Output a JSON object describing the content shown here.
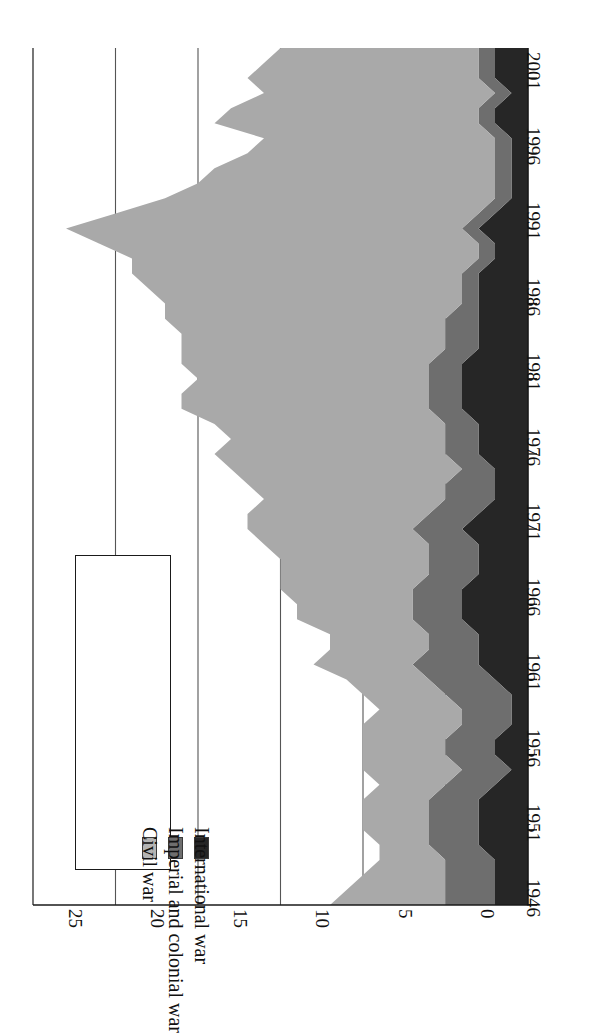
{
  "chart_data": {
    "type": "area",
    "title": "",
    "subtitle": "",
    "xlabel": "",
    "ylabel": "",
    "orientation": "rotated-90-ccw",
    "stacked": true,
    "grid": true,
    "legend_position": "inside-left",
    "xlim": [
      1946,
      2003
    ],
    "ylim": [
      0,
      30
    ],
    "y_ticks": [
      "0",
      "5",
      "10",
      "15",
      "20",
      "25",
      "30"
    ],
    "y_tick_values": [
      0,
      5,
      10,
      15,
      20,
      25,
      30
    ],
    "x_ticks": [
      "1946",
      "1951",
      "1956",
      "1961",
      "1966",
      "1971",
      "1976",
      "1981",
      "1986",
      "1991",
      "1996",
      "2001"
    ],
    "x_tick_values": [
      1946,
      1951,
      1956,
      1961,
      1966,
      1971,
      1976,
      1981,
      1986,
      1991,
      1996,
      2001
    ],
    "x": [
      1946,
      1947,
      1948,
      1949,
      1950,
      1951,
      1952,
      1953,
      1954,
      1955,
      1956,
      1957,
      1958,
      1959,
      1960,
      1961,
      1962,
      1963,
      1964,
      1965,
      1966,
      1967,
      1968,
      1969,
      1970,
      1971,
      1972,
      1973,
      1974,
      1975,
      1976,
      1977,
      1978,
      1979,
      1980,
      1981,
      1982,
      1983,
      1984,
      1985,
      1986,
      1987,
      1988,
      1989,
      1990,
      1991,
      1992,
      1993,
      1994,
      1995,
      1996,
      1997,
      1998,
      1999,
      2000,
      2001,
      2002,
      2003
    ],
    "series": [
      {
        "name": "International war",
        "color": "#262626",
        "values": [
          2,
          2,
          2,
          2,
          3,
          3,
          3,
          3,
          2,
          1,
          2,
          2,
          1,
          1,
          1,
          2,
          3,
          3,
          3,
          4,
          4,
          4,
          3,
          3,
          3,
          4,
          3,
          2,
          2,
          2,
          3,
          3,
          3,
          4,
          4,
          4,
          4,
          3,
          3,
          3,
          3,
          3,
          3,
          2,
          2,
          3,
          2,
          1,
          1,
          1,
          1,
          1,
          2,
          2,
          1,
          2,
          2,
          2
        ]
      },
      {
        "name": "Imperial and colonial war",
        "color": "#6e6e6e",
        "values": [
          3,
          3,
          3,
          3,
          3,
          3,
          3,
          3,
          3,
          3,
          3,
          3,
          3,
          3,
          4,
          4,
          4,
          3,
          3,
          3,
          3,
          3,
          3,
          3,
          3,
          3,
          3,
          3,
          3,
          2,
          2,
          2,
          2,
          2,
          2,
          2,
          2,
          2,
          2,
          2,
          1,
          1,
          1,
          1,
          1,
          1,
          1,
          1,
          1,
          1,
          1,
          1,
          1,
          1,
          1,
          1,
          1,
          1
        ]
      },
      {
        "name": "Civil war",
        "color": "#a9a9a9",
        "values": [
          7,
          6,
          5,
          4,
          3,
          4,
          4,
          4,
          4,
          6,
          5,
          5,
          6,
          5,
          5,
          5,
          6,
          6,
          6,
          7,
          7,
          8,
          9,
          9,
          10,
          10,
          11,
          11,
          12,
          14,
          14,
          13,
          14,
          15,
          15,
          14,
          15,
          16,
          16,
          17,
          18,
          19,
          20,
          21,
          23,
          24,
          22,
          20,
          18,
          17,
          15,
          14,
          16,
          15,
          14,
          14,
          13,
          12
        ]
      }
    ],
    "totals": [
      12,
      11,
      10,
      9,
      9,
      10,
      10,
      10,
      9,
      10,
      10,
      10,
      10,
      9,
      10,
      11,
      13,
      12,
      12,
      14,
      14,
      15,
      15,
      15,
      16,
      17,
      17,
      16,
      17,
      18,
      19,
      18,
      19,
      21,
      21,
      20,
      21,
      21,
      21,
      22,
      22,
      23,
      24,
      24,
      26,
      28,
      25,
      22,
      20,
      19,
      17,
      16,
      19,
      18,
      16,
      17,
      16,
      15
    ]
  },
  "legend": {
    "items": [
      {
        "label": "Civil war",
        "swatch": "civil"
      },
      {
        "label": "Imperial and colonial war",
        "swatch": "imperial"
      },
      {
        "label": "International war",
        "swatch": "international"
      }
    ]
  }
}
